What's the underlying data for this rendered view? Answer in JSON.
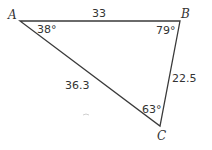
{
  "diagram": {
    "type": "triangle",
    "vertices": [
      {
        "label": "A",
        "angle": "38°"
      },
      {
        "label": "B",
        "angle": "79°"
      },
      {
        "label": "C",
        "angle": "63°"
      }
    ],
    "sides": {
      "AB": "33",
      "BC": "22.5",
      "AC": "36.3"
    },
    "line_color": "#333333"
  }
}
